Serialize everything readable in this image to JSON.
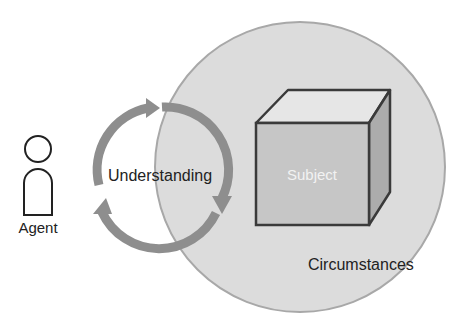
{
  "diagram": {
    "agent": {
      "label": "Agent"
    },
    "cycle": {
      "label": "Understanding",
      "arrow_count": 3
    },
    "subject": {
      "label": "Subject"
    },
    "circumstances": {
      "label": "Circumstances"
    }
  },
  "colors": {
    "circle_fill": "#dcdcdc",
    "circle_stroke": "#a8a8a8",
    "arrow": "#8e8e8e",
    "cube_front": "#c4c4c4",
    "cube_top": "#e4e4e4",
    "cube_side": "#ababab",
    "outline": "#3a3a3a",
    "text_dark": "#222222",
    "text_light": "#f2f2f2"
  }
}
